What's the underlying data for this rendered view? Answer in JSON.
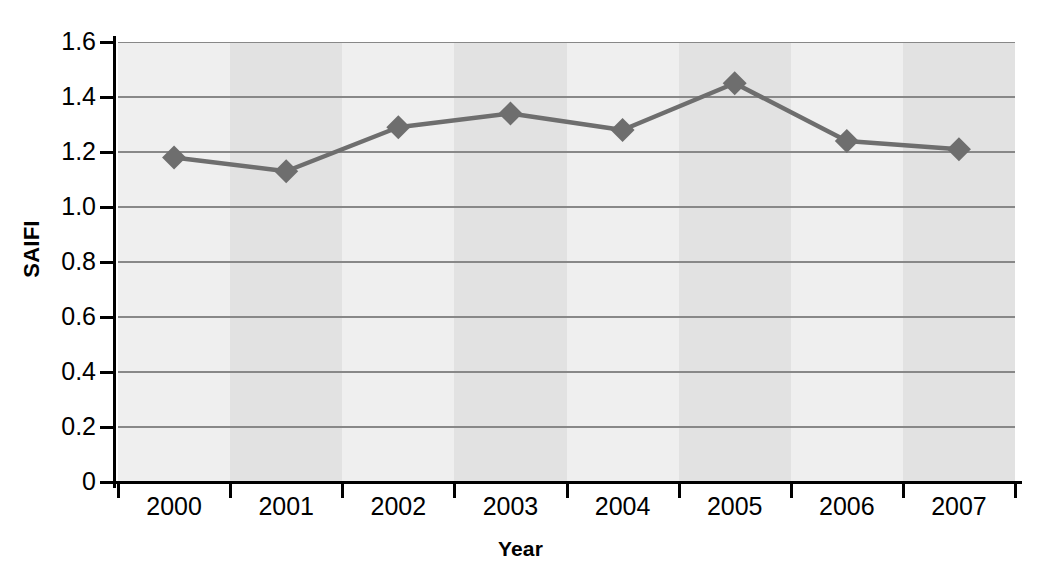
{
  "chart_data": {
    "type": "line",
    "title": "",
    "xlabel": "Year",
    "ylabel": "SAIFI",
    "categories": [
      "2000",
      "2001",
      "2002",
      "2003",
      "2004",
      "2005",
      "2006",
      "2007"
    ],
    "values": [
      1.18,
      1.13,
      1.29,
      1.34,
      1.28,
      1.45,
      1.24,
      1.21
    ],
    "series": [
      {
        "name": "SAIFI",
        "values": [
          1.18,
          1.13,
          1.29,
          1.34,
          1.28,
          1.45,
          1.24,
          1.21
        ]
      }
    ],
    "ylim": [
      0,
      1.6
    ],
    "ytick_values": [
      0,
      0.2,
      0.4,
      0.6,
      0.8,
      1.0,
      1.2,
      1.4,
      1.6
    ],
    "ytick_labels": [
      "0",
      "0.2",
      "0.4",
      "0.6",
      "0.8",
      "1.0",
      "1.2",
      "1.4",
      "1.6"
    ],
    "xtick_labels": [
      "2000",
      "2001",
      "2002",
      "2003",
      "2004",
      "2005",
      "2006",
      "2007"
    ],
    "grid": "horizontal",
    "legend": "none",
    "marker": "diamond",
    "colors": {
      "line": "#6e6e6e",
      "marker": "#6e6e6e",
      "gridline": "#888888",
      "axis": "#000000",
      "plot_background_light": "#efefef",
      "plot_background_dark": "#e2e2e2",
      "page_background": "#ffffff",
      "text": "#000000"
    }
  },
  "axes": {
    "y_title": "SAIFI",
    "x_title": "Year"
  }
}
